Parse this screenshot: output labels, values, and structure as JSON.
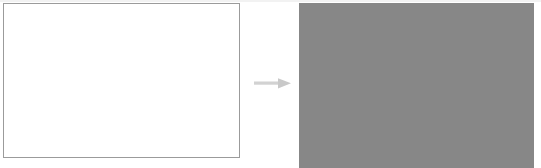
{
  "figure": {
    "title": "Image transformation: blank input to uniform gray output",
    "type": "before-after-diagram",
    "background_color": "#ffffff",
    "width": 541,
    "height": 168
  },
  "before_panel": {
    "name": "input-image",
    "caption": "",
    "fill_color": "#ffffff",
    "border_color": "#9b9b9b",
    "border_width": "1px",
    "x": 3,
    "y": 3,
    "width": 237,
    "height": 155
  },
  "arrow": {
    "name": "transformation-arrow",
    "label": "",
    "direction": "right",
    "color": "#c9c9c9",
    "shaft_color": "#d2d2d2",
    "x": 254,
    "y": 76,
    "width": 38,
    "height": 15
  },
  "after_panel": {
    "name": "output-image",
    "caption": "",
    "fill_color": "#878787",
    "border_color": "#878787",
    "x": 299,
    "y": 3,
    "width": 235,
    "height": 165
  },
  "top_hairline": {
    "color": "#f2f2f2"
  }
}
